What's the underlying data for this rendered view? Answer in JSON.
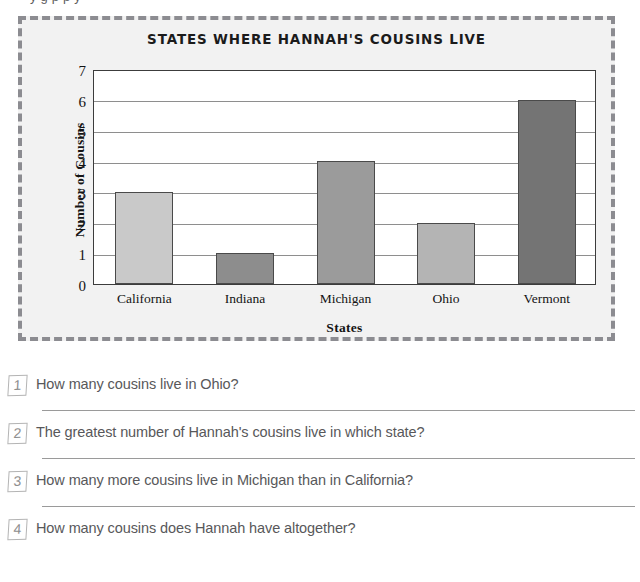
{
  "worksheet": {
    "cutoff_text": "y                                                                g p                               p y",
    "questions": [
      {
        "number": "1",
        "text": "How many cousins live in Ohio?",
        "has_answer_line": true
      },
      {
        "number": "2",
        "text": "The greatest number of Hannah's cousins live in which state?",
        "has_answer_line": true
      },
      {
        "number": "3",
        "text": "How many more cousins live in Michigan than in California?",
        "has_answer_line": true
      },
      {
        "number": "4",
        "text": "How many cousins does Hannah have altogether?",
        "has_answer_line": false
      }
    ]
  },
  "chart_data": {
    "type": "bar",
    "title": "STATES WHERE HANNAH'S COUSINS LIVE",
    "xlabel": "States",
    "ylabel": "Number of Cousins",
    "categories": [
      "California",
      "Indiana",
      "Michigan",
      "Ohio",
      "Vermont"
    ],
    "values": [
      3,
      1,
      4,
      2,
      6
    ],
    "bar_colors": [
      "#c9c9c9",
      "#8d8d8d",
      "#9b9b9b",
      "#b4b4b4",
      "#747474"
    ],
    "bar_border_color": "#4a4a4a",
    "ylim": [
      0,
      7
    ],
    "ytick_labels": [
      "0",
      "1",
      "2",
      "3",
      "4",
      "5",
      "6",
      "7"
    ],
    "grid": true,
    "legend": "none",
    "plot_background": "#ffffff",
    "panel_background": "#f2f2f2",
    "frame_border_color": "#8c8c91"
  }
}
